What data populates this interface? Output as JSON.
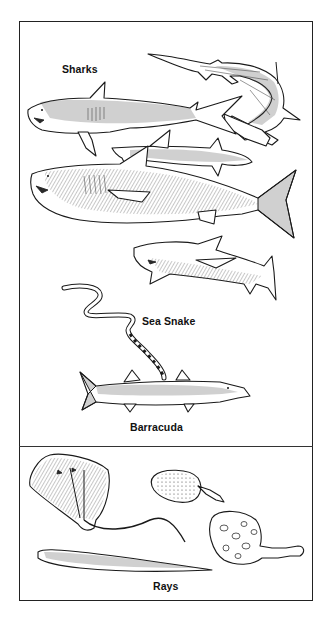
{
  "figure": {
    "background": "#ffffff",
    "border_color": "#222222",
    "sections": [
      {
        "id": "upper",
        "labels": {
          "sharks": "Sharks",
          "sea_snake": "Sea Snake",
          "barracuda": "Barracuda"
        },
        "creatures": [
          "tiger-shark",
          "hammerhead-shark",
          "whitetip-shark",
          "great-white-shark",
          "reef-shark",
          "sea-snake",
          "barracuda"
        ]
      },
      {
        "id": "lower",
        "labels": {
          "rays": "Rays"
        },
        "creatures": [
          "stingray",
          "round-stingray",
          "electric-ray",
          "sawfish-ray"
        ]
      }
    ]
  }
}
